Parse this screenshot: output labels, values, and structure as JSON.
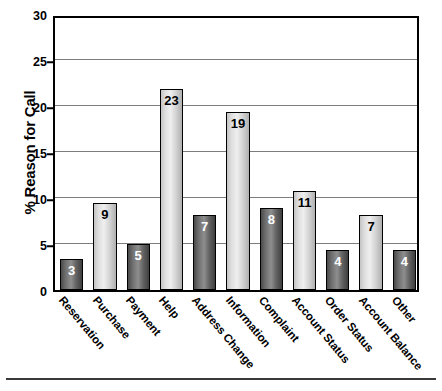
{
  "chart_data": {
    "type": "bar",
    "title": "",
    "xlabel": "",
    "ylabel": "% Reason for Call",
    "ylim": [
      0,
      30
    ],
    "yticks": [
      0,
      5,
      10,
      15,
      20,
      25,
      30
    ],
    "grid": true,
    "legend": "none",
    "categories": [
      "Reservation",
      "Purchase",
      "Payment",
      "Help",
      "Address Change",
      "Information",
      "Complaint",
      "Account Status",
      "Order Status",
      "Account Balance",
      "Other"
    ],
    "values": [
      3.4,
      9.5,
      5.0,
      21.9,
      8.1,
      19.3,
      8.9,
      10.8,
      4.4,
      8.2,
      4.4
    ],
    "data_labels": [
      "3",
      "9",
      "5",
      "23",
      "7",
      "19",
      "8",
      "11",
      "4",
      "7",
      "4"
    ],
    "bar_shades": [
      "dark",
      "light",
      "dark",
      "light",
      "dark",
      "light",
      "dark",
      "light",
      "dark",
      "light",
      "dark"
    ]
  },
  "colors": {
    "axis": "#000000",
    "gridline": "#7d7d7d",
    "bar_dark": "#6f6f6f",
    "bar_light": "#dedede",
    "label_on_dark": "#ffffff",
    "label_on_light": "#000000",
    "background": "#ffffff"
  }
}
